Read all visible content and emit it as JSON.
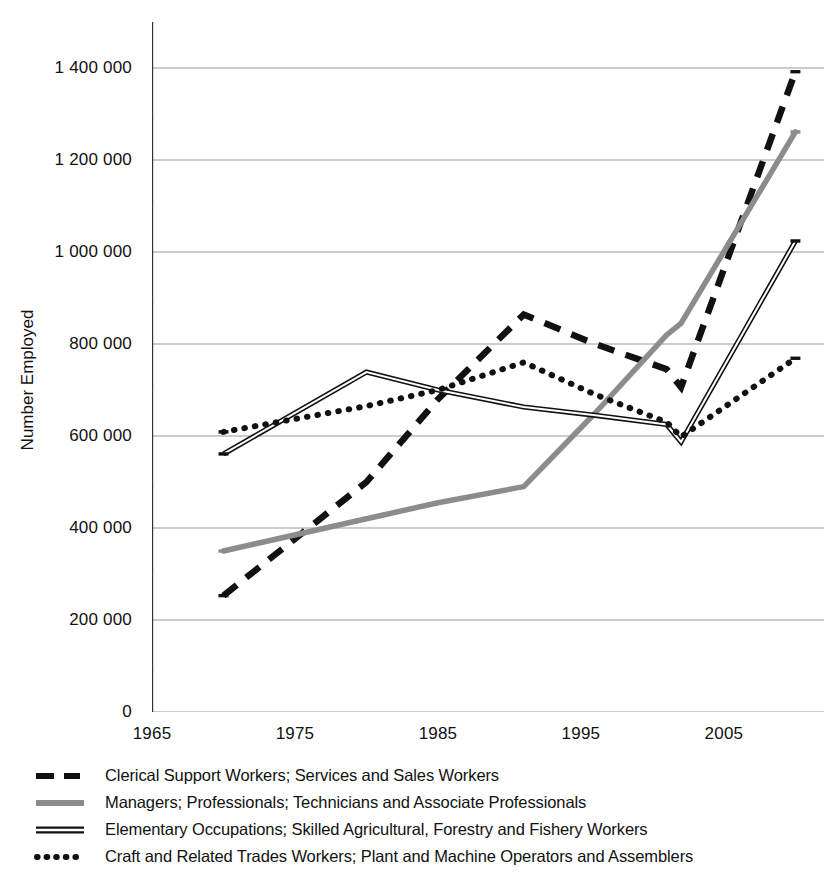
{
  "chart_data": {
    "type": "line",
    "title": "",
    "xlabel": "",
    "ylabel": "Number Employed",
    "xlim": [
      1965,
      2012
    ],
    "ylim": [
      0,
      1500000
    ],
    "grid": true,
    "grid_axis": "y",
    "legend_position": "below",
    "x_ticks": [
      "1965",
      "1975",
      "1985",
      "1995",
      "2005"
    ],
    "x_tick_values": [
      1965,
      1975,
      1985,
      1995,
      2005
    ],
    "x_minor_tick_values": [
      1970,
      1980,
      1990,
      2000,
      2010
    ],
    "y_ticks": [
      "0",
      "200 000",
      "400 000",
      "600 000",
      "800 000",
      "1 000 000",
      "1 200 000",
      "1 400 000"
    ],
    "y_tick_values": [
      0,
      200000,
      400000,
      600000,
      800000,
      1000000,
      1200000,
      1400000
    ],
    "x": [
      1970,
      1980,
      1985,
      1991,
      1996,
      2001,
      2002,
      2010
    ],
    "series": [
      {
        "name": "Clerical Support Workers; Services and Sales Workers",
        "style": "dashed",
        "color": "#111111",
        "x": [
          1970,
          1980,
          1985,
          1991,
          1996,
          2001,
          2002,
          2010
        ],
        "values": [
          253000,
          500000,
          680000,
          864000,
          800000,
          745000,
          706000,
          1392000
        ]
      },
      {
        "name": "Managers; Professionals; Technicians and Associate Professionals",
        "style": "solid-thick-gray",
        "color": "#8c8c8c",
        "x": [
          1970,
          1980,
          1985,
          1991,
          1996,
          2001,
          2002,
          2010
        ],
        "values": [
          350000,
          420000,
          455000,
          490000,
          650000,
          820000,
          845000,
          1261000
        ]
      },
      {
        "name": "Elementary Occupations; Skilled Agricultural, Forestry and Fishery Workers",
        "style": "double-line",
        "color": "#111111",
        "x": [
          1970,
          1980,
          1985,
          1991,
          1996,
          2001,
          2002,
          2010
        ],
        "values": [
          561000,
          739000,
          700000,
          663000,
          645000,
          625000,
          587000,
          1024000
        ]
      },
      {
        "name": "Craft and Related Trades Workers; Plant and Machine Operators and Assemblers",
        "style": "dotted",
        "color": "#111111",
        "x": [
          1970,
          1980,
          1985,
          1991,
          1996,
          2001,
          2002,
          2010
        ],
        "values": [
          609000,
          665000,
          700000,
          760000,
          690000,
          630000,
          598000,
          769000
        ]
      }
    ]
  },
  "axis": {
    "y_title": "Number Employed"
  },
  "legend": {
    "items": [
      {
        "label": "Clerical Support Workers; Services and Sales Workers",
        "key": "dashed-line-key"
      },
      {
        "label": "Managers; Professionals; Technicians and Associate Professionals",
        "key": "gray-solid-line-key"
      },
      {
        "label": "Elementary Occupations; Skilled Agricultural, Forestry and Fishery Workers",
        "key": "double-line-key"
      },
      {
        "label": "Craft and Related Trades Workers; Plant and Machine Operators and Assemblers",
        "key": "dotted-line-key"
      }
    ]
  }
}
